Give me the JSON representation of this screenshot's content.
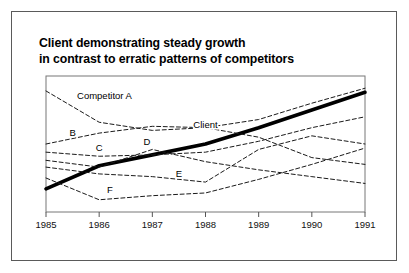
{
  "figure": {
    "background": "#ffffff",
    "frame_color": "#5a5a5a",
    "title_lines": [
      "Client demonstrating steady growth",
      "in contrast to erratic patterns of competitors"
    ]
  },
  "chart_data": {
    "type": "line",
    "title": "Client demonstrating steady growth in contrast to erratic patterns of competitors",
    "xlabel": "",
    "ylabel": "",
    "categories": [
      "1985",
      "1986",
      "1987",
      "1988",
      "1989",
      "1990",
      "1991"
    ],
    "x": [
      1985,
      1986,
      1987,
      1988,
      1989,
      1990,
      1991
    ],
    "xlim": [
      1985,
      1991
    ],
    "ylim": [
      0,
      100
    ],
    "grid": false,
    "legend": "inline-labels",
    "axis_color": "#555555",
    "series": [
      {
        "name": "Client",
        "label": "Client",
        "style": "solid-thick",
        "color": "#000000",
        "width": 3.6,
        "label_x": 1988.0,
        "label_y": 62,
        "values": [
          17,
          34,
          42,
          50,
          62,
          75,
          88
        ]
      },
      {
        "name": "Competitor A",
        "label": "Competitor A",
        "style": "dashed",
        "color": "#1a1a1a",
        "width": 1,
        "label_x": 1986.1,
        "label_y": 83,
        "values": [
          89,
          66,
          60,
          62,
          55,
          40,
          35
        ]
      },
      {
        "name": "B",
        "label": "B",
        "style": "dashed",
        "color": "#1a1a1a",
        "width": 1,
        "label_x": 1985.5,
        "label_y": 56,
        "values": [
          50,
          58,
          63,
          62,
          68,
          80,
          91
        ]
      },
      {
        "name": "C",
        "label": "C",
        "style": "dashed",
        "color": "#1a1a1a",
        "width": 1,
        "label_x": 1986.0,
        "label_y": 45,
        "values": [
          44,
          41,
          42,
          44,
          52,
          62,
          70
        ]
      },
      {
        "name": "D",
        "label": "D",
        "style": "dashed",
        "color": "#1a1a1a",
        "width": 1,
        "label_x": 1986.9,
        "label_y": 49,
        "values": [
          38,
          33,
          46,
          37,
          31,
          26,
          21
        ]
      },
      {
        "name": "E",
        "label": "E",
        "style": "dashed",
        "color": "#1a1a1a",
        "width": 1,
        "label_x": 1987.5,
        "label_y": 26,
        "values": [
          33,
          28,
          26,
          22,
          46,
          56,
          50
        ]
      },
      {
        "name": "F",
        "label": "F",
        "style": "dashed",
        "color": "#1a1a1a",
        "width": 1,
        "label_x": 1986.2,
        "label_y": 14,
        "values": [
          25,
          9,
          12,
          14,
          24,
          35,
          47
        ]
      }
    ]
  }
}
